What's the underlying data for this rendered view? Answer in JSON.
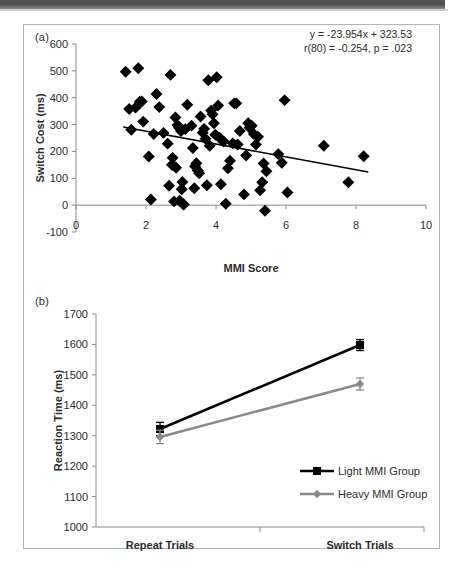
{
  "figure": {
    "panel_a_label": "(a)",
    "panel_b_label": "(b)"
  },
  "chart_data": [
    {
      "id": "panel-a",
      "type": "scatter",
      "title": "",
      "xlabel": "MMI Score",
      "ylabel": "Switch Cost (ms)",
      "xlim": [
        0,
        10
      ],
      "ylim": [
        -100,
        600
      ],
      "xticks": [
        0,
        2,
        4,
        6,
        8,
        10
      ],
      "yticks": [
        -100,
        0,
        100,
        200,
        300,
        400,
        500,
        600
      ],
      "grid": false,
      "annotations": [
        "y = -23.954x + 323.53",
        "r(80) = -0.254, p = .023"
      ],
      "trendline": {
        "slope": -23.954,
        "intercept": 323.53,
        "x_start": 1.35,
        "x_end": 8.35,
        "color": "#000000"
      },
      "marker": {
        "shape": "diamond",
        "color": "#000000",
        "size": 6
      },
      "points": [
        [
          1.42,
          497
        ],
        [
          1.52,
          358
        ],
        [
          1.58,
          281
        ],
        [
          1.7,
          363
        ],
        [
          1.78,
          510
        ],
        [
          1.82,
          385
        ],
        [
          1.88,
          386
        ],
        [
          1.92,
          311
        ],
        [
          2.08,
          181
        ],
        [
          2.14,
          21
        ],
        [
          2.22,
          265
        ],
        [
          2.3,
          414
        ],
        [
          2.38,
          365
        ],
        [
          2.5,
          269
        ],
        [
          2.62,
          229
        ],
        [
          2.66,
          72
        ],
        [
          2.7,
          485
        ],
        [
          2.74,
          150
        ],
        [
          2.76,
          176
        ],
        [
          2.78,
          148
        ],
        [
          2.8,
          14
        ],
        [
          2.84,
          326
        ],
        [
          2.86,
          139
        ],
        [
          2.9,
          298
        ],
        [
          2.94,
          288
        ],
        [
          2.96,
          16
        ],
        [
          3.0,
          276
        ],
        [
          3.02,
          59
        ],
        [
          3.04,
          86
        ],
        [
          3.06,
          4
        ],
        [
          3.08,
          2
        ],
        [
          3.12,
          283
        ],
        [
          3.18,
          374
        ],
        [
          3.3,
          296
        ],
        [
          3.34,
          213
        ],
        [
          3.38,
          63
        ],
        [
          3.4,
          145
        ],
        [
          3.44,
          156
        ],
        [
          3.48,
          129
        ],
        [
          3.52,
          119
        ],
        [
          3.56,
          330
        ],
        [
          3.62,
          270
        ],
        [
          3.66,
          284
        ],
        [
          3.7,
          247
        ],
        [
          3.74,
          74
        ],
        [
          3.78,
          465
        ],
        [
          3.82,
          221
        ],
        [
          3.86,
          352
        ],
        [
          3.9,
          338
        ],
        [
          3.94,
          305
        ],
        [
          3.98,
          262
        ],
        [
          4.02,
          476
        ],
        [
          4.06,
          371
        ],
        [
          4.1,
          251
        ],
        [
          4.14,
          78
        ],
        [
          4.22,
          237
        ],
        [
          4.28,
          5
        ],
        [
          4.34,
          137
        ],
        [
          4.4,
          165
        ],
        [
          4.48,
          230
        ],
        [
          4.52,
          379
        ],
        [
          4.58,
          379
        ],
        [
          4.62,
          226
        ],
        [
          4.68,
          276
        ],
        [
          4.8,
          40
        ],
        [
          4.86,
          185
        ],
        [
          4.92,
          305
        ],
        [
          4.96,
          288
        ],
        [
          5.02,
          296
        ],
        [
          5.08,
          265
        ],
        [
          5.14,
          226
        ],
        [
          5.2,
          255
        ],
        [
          5.26,
          55
        ],
        [
          5.32,
          85
        ],
        [
          5.36,
          155
        ],
        [
          5.4,
          -21
        ],
        [
          5.44,
          126
        ],
        [
          5.78,
          190
        ],
        [
          5.88,
          158
        ],
        [
          5.96,
          391
        ],
        [
          6.04,
          47
        ],
        [
          7.08,
          221
        ],
        [
          7.78,
          85
        ],
        [
          8.22,
          182
        ]
      ]
    },
    {
      "id": "panel-b",
      "type": "line",
      "title": "",
      "xlabel": "",
      "ylabel": "Reaction Time (ms)",
      "categories": [
        "Repeat Trials",
        "Switch Trials"
      ],
      "ylim": [
        1000,
        1700
      ],
      "yticks": [
        1000,
        1100,
        1200,
        1300,
        1400,
        1500,
        1600,
        1700
      ],
      "grid": false,
      "legend_position": "inside-bottom-right",
      "series": [
        {
          "name": "Light MMI Group",
          "values": [
            1322,
            1598
          ],
          "errors": [
            22,
            18
          ],
          "color": "#000000",
          "marker": "square"
        },
        {
          "name": "Heavy MMI Group",
          "values": [
            1296,
            1470
          ],
          "errors": [
            22,
            20
          ],
          "color": "#8a8a8a",
          "marker": "diamond"
        }
      ]
    }
  ]
}
